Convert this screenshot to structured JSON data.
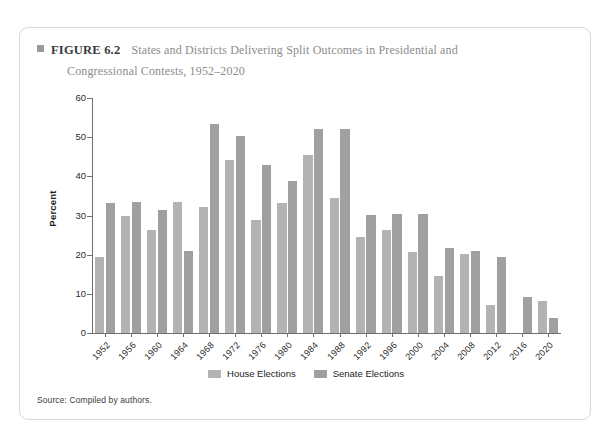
{
  "figure": {
    "marker": "square-marker",
    "number_label": "FIGURE 6.2",
    "title_line_1": "States and Districts Delivering Split Outcomes in Presidential and",
    "title_line_2": "Congressional Contests, 1952–2020",
    "source": "Source: Compiled by authors."
  },
  "legend": {
    "items": [
      {
        "label": "House Elections",
        "color": "#b3b3b3"
      },
      {
        "label": "Senate Elections",
        "color": "#a0a0a0"
      }
    ]
  },
  "chart_data": {
    "type": "bar",
    "title": "States and Districts Delivering Split Outcomes in Presidential and Congressional Contests, 1952–2020",
    "xlabel": "",
    "ylabel": "Percent",
    "ylim": [
      0,
      60
    ],
    "yticks": [
      0,
      10,
      20,
      30,
      40,
      50,
      60
    ],
    "ytick_labels": [
      "0",
      "10",
      "20",
      "30",
      "40",
      "50",
      "60"
    ],
    "grid": false,
    "legend_position": "bottom-center",
    "categories": [
      "1952",
      "1956",
      "1960",
      "1964",
      "1968",
      "1972",
      "1976",
      "1980",
      "1984",
      "1988",
      "1992",
      "1996",
      "2000",
      "2004",
      "2008",
      "2012",
      "2016",
      "2020"
    ],
    "series": [
      {
        "name": "House Elections",
        "color": "#b3b3b3",
        "values": [
          19.3,
          30.0,
          26.4,
          33.5,
          32.3,
          44.3,
          28.9,
          33.2,
          45.5,
          34.5,
          24.4,
          26.2,
          20.7,
          14.6,
          20.2,
          7.1,
          0.0,
          8.3
        ]
      },
      {
        "name": "Senate Elections",
        "color": "#a0a0a0",
        "values": [
          33.3,
          33.5,
          31.5,
          20.9,
          53.3,
          50.3,
          42.8,
          38.7,
          52.0,
          52.0,
          30.2,
          30.4,
          30.3,
          21.6,
          21.0,
          19.4,
          9.2,
          3.9
        ]
      }
    ]
  }
}
